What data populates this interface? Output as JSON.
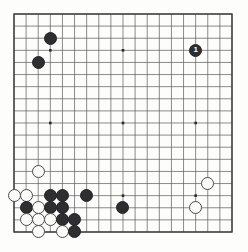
{
  "diagram": {
    "kind": "go-board-diagram",
    "board_size": 19,
    "title": "",
    "background_color": "#fdfdfc",
    "line_color": "#5a5a5c",
    "border_color": "#3a3a3c",
    "black_stone_color": "#2e2e30",
    "white_stone_color": "#fbfbfa",
    "white_stone_border_color": "#4a4a4c",
    "star_point_color": "#2a2a2c",
    "geometry": {
      "left": 14,
      "top": 14,
      "right": 232,
      "bottom": 232,
      "spacing": 12.11,
      "stone_diameter": 13
    },
    "star_points": [
      {
        "col": 4,
        "row": 4
      },
      {
        "col": 10,
        "row": 4
      },
      {
        "col": 16,
        "row": 4
      },
      {
        "col": 4,
        "row": 10
      },
      {
        "col": 10,
        "row": 10
      },
      {
        "col": 16,
        "row": 10
      },
      {
        "col": 4,
        "row": 16
      },
      {
        "col": 10,
        "row": 16
      },
      {
        "col": 16,
        "row": 16
      }
    ],
    "stones": [
      {
        "color": "black",
        "col": 4,
        "row": 3,
        "label": ""
      },
      {
        "color": "black",
        "col": 3,
        "row": 5,
        "label": ""
      },
      {
        "color": "black",
        "col": 16,
        "row": 4,
        "label": "1"
      },
      {
        "color": "white",
        "col": 3,
        "row": 14,
        "label": ""
      },
      {
        "color": "white",
        "col": 17,
        "row": 15,
        "label": ""
      },
      {
        "color": "white",
        "col": 16,
        "row": 17,
        "label": ""
      },
      {
        "color": "white",
        "col": 1,
        "row": 16,
        "label": ""
      },
      {
        "color": "white",
        "col": 2,
        "row": 16,
        "label": ""
      },
      {
        "color": "black",
        "col": 4,
        "row": 16,
        "label": ""
      },
      {
        "color": "black",
        "col": 5,
        "row": 16,
        "label": ""
      },
      {
        "color": "black",
        "col": 7,
        "row": 16,
        "label": ""
      },
      {
        "color": "black",
        "col": 2,
        "row": 17,
        "label": ""
      },
      {
        "color": "white",
        "col": 3,
        "row": 17,
        "label": ""
      },
      {
        "color": "black",
        "col": 4,
        "row": 17,
        "label": ""
      },
      {
        "color": "black",
        "col": 5,
        "row": 17,
        "label": ""
      },
      {
        "color": "black",
        "col": 10,
        "row": 17,
        "label": ""
      },
      {
        "color": "white",
        "col": 2,
        "row": 18,
        "label": ""
      },
      {
        "color": "white",
        "col": 3,
        "row": 18,
        "label": ""
      },
      {
        "color": "white",
        "col": 4,
        "row": 18,
        "label": ""
      },
      {
        "color": "black",
        "col": 5,
        "row": 18,
        "label": ""
      },
      {
        "color": "black",
        "col": 6,
        "row": 18,
        "label": ""
      },
      {
        "color": "white",
        "col": 3,
        "row": 19,
        "label": ""
      },
      {
        "color": "white",
        "col": 5,
        "row": 19,
        "label": ""
      },
      {
        "color": "black",
        "col": 6,
        "row": 19,
        "label": ""
      }
    ]
  }
}
